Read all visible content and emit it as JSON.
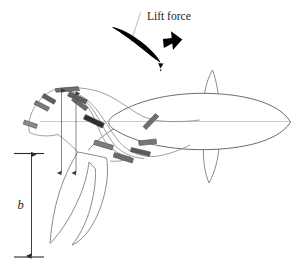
{
  "figure": {
    "title_visible": false,
    "background_color": "#ffffff",
    "labels": {
      "lift_force": "Lift force",
      "span_symbol": "b"
    },
    "colors": {
      "outline_stroke": "#6e6e6e",
      "body_stroke": "#5a5a5a",
      "wake_stroke": "#888888",
      "vortex_fill_dark": "#3c3c3c",
      "vortex_fill_light": "#8c8c8c",
      "dimension_stroke": "#2a2a2a",
      "centerline_stroke": "#b4b4b4",
      "foil_fill": "#000000",
      "text_color": "#1a1a1a"
    },
    "elements": [
      {
        "name": "lift-force-label",
        "kind": "text",
        "text": "Lift force"
      },
      {
        "name": "lift-force-arrow",
        "kind": "block-arrow",
        "direction": "up-right",
        "angle_deg": 45
      },
      {
        "name": "hydrofoil-section",
        "kind": "filled-airfoil",
        "angle_deg": 35,
        "fill": "#000000"
      },
      {
        "name": "flow-chord-line",
        "kind": "line",
        "stroke": "#a9a9a9"
      },
      {
        "name": "foil-tip-marker",
        "kind": "arrowhead"
      },
      {
        "name": "fish-body-outline",
        "kind": "outline"
      },
      {
        "name": "dorsal-fin-outline",
        "kind": "outline"
      },
      {
        "name": "ventral-fin-outline",
        "kind": "outline"
      },
      {
        "name": "caudal-fin-outline",
        "kind": "outline"
      },
      {
        "name": "body-centerline",
        "kind": "line"
      },
      {
        "name": "wake-vortex-rings",
        "kind": "curves",
        "count": 4
      },
      {
        "name": "vortex-direction-markers",
        "kind": "arrow-markers",
        "count": 12
      },
      {
        "name": "span-dimension-arrow",
        "kind": "double-arrow",
        "orientation": "vertical"
      },
      {
        "name": "span-upper-tick",
        "kind": "tick"
      },
      {
        "name": "span-lower-tick",
        "kind": "tick"
      },
      {
        "name": "wake-height-arrow-left",
        "kind": "double-arrow",
        "orientation": "vertical"
      },
      {
        "name": "wake-height-arrow-right",
        "kind": "double-arrow",
        "orientation": "vertical"
      },
      {
        "name": "span-symbol-label",
        "kind": "text",
        "text": "b"
      }
    ]
  }
}
